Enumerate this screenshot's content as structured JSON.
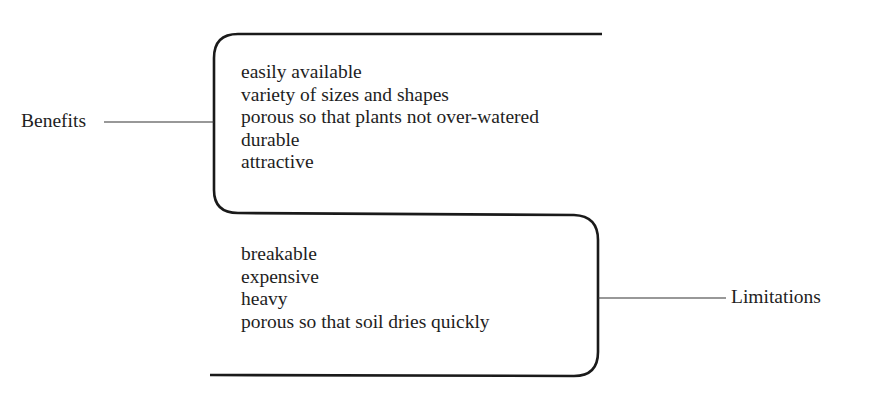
{
  "diagram": {
    "type": "two-branch comparison bracket",
    "benefits": {
      "label": "Benefits",
      "items": [
        "easily available",
        "variety of sizes and shapes",
        "porous so that plants not over-watered",
        "durable",
        "attractive"
      ]
    },
    "limitations": {
      "label": "Limitations",
      "items": [
        "breakable",
        "expensive",
        "heavy",
        "porous so that soil dries quickly"
      ]
    },
    "colors": {
      "line": "#1a1a1a",
      "text": "#1e1e1e",
      "background": "#ffffff"
    }
  }
}
